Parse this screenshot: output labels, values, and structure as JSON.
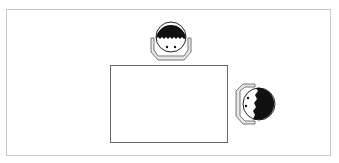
{
  "diagram": {
    "title": "",
    "elements": [
      {
        "type": "table",
        "shape": "rectangle"
      },
      {
        "type": "person-seat",
        "position": "top",
        "facing": "down"
      },
      {
        "type": "person-seat",
        "position": "right",
        "facing": "left"
      }
    ],
    "colors": {
      "frame": "#c8c8c8",
      "table_stroke": "#666666",
      "hair": "#111111",
      "chair_fill": "#e6e6e6",
      "chair_stroke": "#777777",
      "face": "#ffffff"
    }
  }
}
